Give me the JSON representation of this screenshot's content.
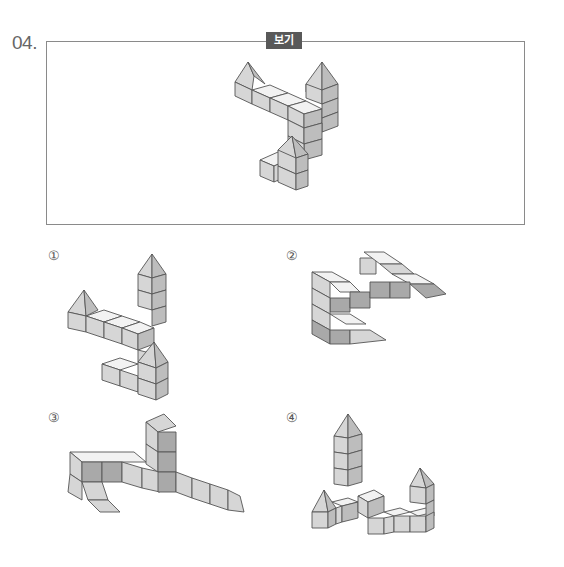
{
  "question": {
    "number": "04.",
    "reference_label": "보기"
  },
  "options": [
    {
      "label": "①"
    },
    {
      "label": "②"
    },
    {
      "label": "③"
    },
    {
      "label": "④"
    }
  ]
}
